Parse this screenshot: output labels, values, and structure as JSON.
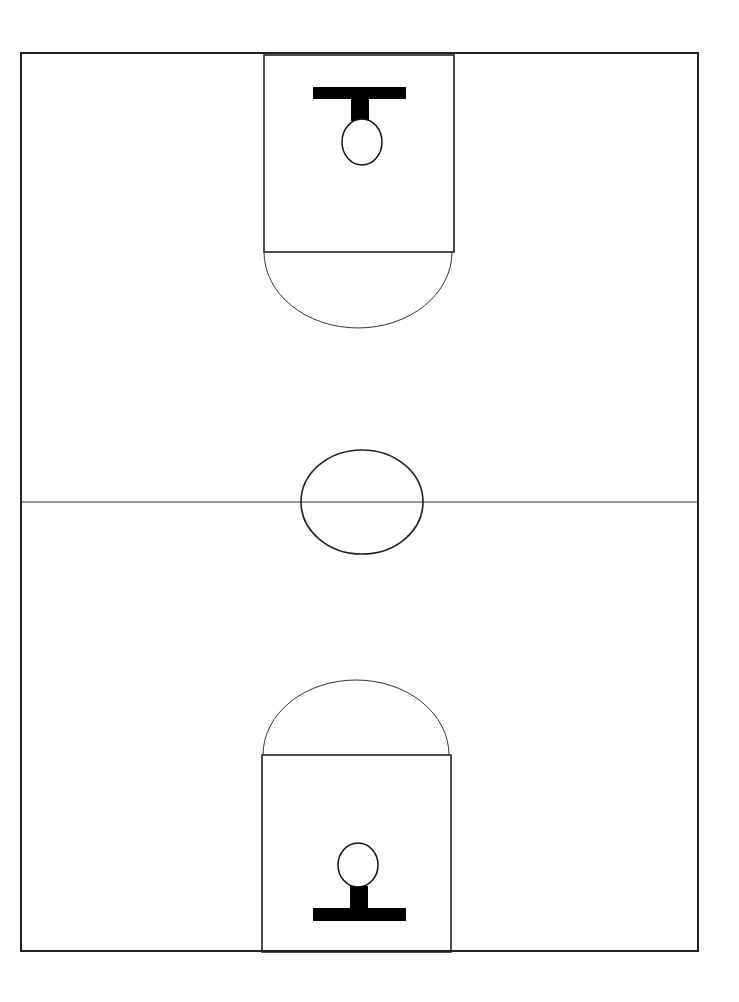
{
  "diagram": {
    "type": "basketball-half-court-layout",
    "colors": {
      "background": "#ffffff",
      "line": "#222222",
      "fill": "#000000"
    },
    "court": {
      "x": 21,
      "y": 53,
      "width": 677,
      "height": 898
    },
    "midline": {
      "y": 502
    },
    "center_circle": {
      "cx": 362,
      "cy": 502,
      "rx": 61,
      "ry": 52
    },
    "top_end": {
      "key": {
        "x": 264,
        "y": 55,
        "width": 190,
        "height": 197
      },
      "arc": {
        "cx": 358,
        "cy": 252,
        "rx": 94,
        "ry": 76
      },
      "backboard": {
        "x": 313,
        "y": 87,
        "width": 93,
        "height": 12
      },
      "stem": {
        "x": 351,
        "y": 99,
        "width": 18,
        "height": 22
      },
      "hoop": {
        "cx": 362,
        "cy": 142,
        "rx": 20,
        "ry": 23
      }
    },
    "bottom_end": {
      "key": {
        "x": 262,
        "y": 755,
        "width": 189,
        "height": 197
      },
      "arc": {
        "cx": 356,
        "cy": 755,
        "rx": 93,
        "ry": 75
      },
      "backboard": {
        "x": 313,
        "y": 908,
        "width": 93,
        "height": 13
      },
      "stem": {
        "x": 350,
        "y": 886,
        "width": 18,
        "height": 22
      },
      "hoop": {
        "cx": 358,
        "cy": 865,
        "rx": 20,
        "ry": 22
      }
    }
  }
}
